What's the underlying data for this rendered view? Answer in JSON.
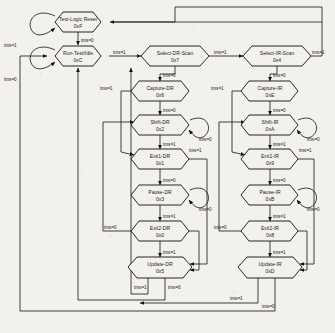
{
  "diagram": {
    "signal": "tms",
    "colors": {
      "background": "#f2f1ee",
      "stroke": "#111111",
      "text": "#1c1c1c"
    }
  },
  "states": [
    {
      "id": "test-logic-reset",
      "name": "Test-Logic Reset",
      "code": "0xF",
      "cx": 78,
      "cy": 22
    },
    {
      "id": "run-test-idle",
      "name": "Run-Test/Idle",
      "code": "0xC",
      "cx": 78,
      "cy": 56
    },
    {
      "id": "select-dr-scan",
      "name": "Select-DR-Scan",
      "code": "0x7",
      "cx": 175,
      "cy": 56
    },
    {
      "id": "capture-dr",
      "name": "Capture-DR",
      "code": "0x6",
      "cx": 160,
      "cy": 91
    },
    {
      "id": "shift-dr",
      "name": "Shift-DR",
      "code": "0x2",
      "cx": 160,
      "cy": 125
    },
    {
      "id": "exit1-dr",
      "name": "Exit1-DR",
      "code": "0x1",
      "cx": 160,
      "cy": 159
    },
    {
      "id": "pause-dr",
      "name": "Pause-DR",
      "code": "0x3",
      "cx": 160,
      "cy": 195
    },
    {
      "id": "exit2-dr",
      "name": "Exit2-DR",
      "code": "0x0",
      "cx": 160,
      "cy": 231
    },
    {
      "id": "update-dr",
      "name": "Update-DR",
      "code": "0x5",
      "cx": 160,
      "cy": 267
    },
    {
      "id": "select-ir-scan",
      "name": "Select-IR-Scan",
      "code": "0x4",
      "cx": 277,
      "cy": 56
    },
    {
      "id": "capture-ir",
      "name": "Capture-IR",
      "code": "0xE",
      "cx": 270,
      "cy": 91
    },
    {
      "id": "shift-ir",
      "name": "Shift-IR",
      "code": "0xA",
      "cx": 270,
      "cy": 125
    },
    {
      "id": "exit1-ir",
      "name": "Exit1-IR",
      "code": "0x9",
      "cx": 270,
      "cy": 159
    },
    {
      "id": "pause-ir",
      "name": "Pause-IR",
      "code": "0xB",
      "cx": 270,
      "cy": 195
    },
    {
      "id": "exit2-ir",
      "name": "Exit2-IR",
      "code": "0x8",
      "cx": 270,
      "cy": 231
    },
    {
      "id": "update-ir",
      "name": "Update-IR",
      "code": "0xD",
      "cx": 270,
      "cy": 267
    }
  ],
  "edge_labels": {
    "tlr_self": "tms=1",
    "tlr_to_rti": "tms=0",
    "rti_self": "tms=0",
    "rti_to_seldr": "tms=1",
    "seldr_to_capdr": "tms=0",
    "seldr_to_selir": "tms=1",
    "capdr_to_shiftdr": "tms=0",
    "capdr_to_exit1dr": "tms=1",
    "shiftdr_self": "tms=0",
    "shiftdr_to_exit1": "tms=1",
    "exit1dr_to_pause": "tms=0",
    "exit1dr_to_update": "tms=1",
    "pausedr_self": "tms=0",
    "pausedr_to_exit2": "tms=1",
    "exit2dr_to_shift": "tms=0",
    "exit2dr_to_update": "tms=1",
    "updatedr_to_rti": "tms=0",
    "updatedr_to_sel": "tms=1",
    "selir_to_capir": "tms=0",
    "selir_to_tlr": "tms=1",
    "capir_to_shiftir": "tms=0",
    "capir_to_exit1ir": "tms=1",
    "shiftir_self": "tms=0",
    "shiftir_to_exit1": "tms=1",
    "exit1ir_to_pause": "tms=0",
    "exit1ir_to_update": "tms=1",
    "pauseir_self": "tms=0",
    "pauseir_to_exit2": "tms=1",
    "exit2ir_to_shift": "tms=0",
    "exit2ir_to_update": "tms=1",
    "updateir_to_rti": "tms=0",
    "updateir_to_sel": "tms=1"
  }
}
